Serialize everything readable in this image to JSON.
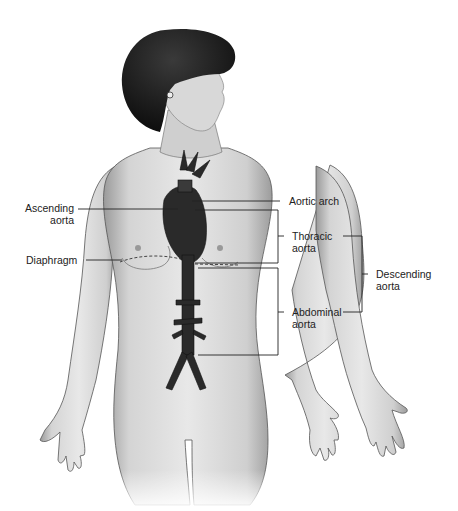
{
  "diagram": {
    "labels": {
      "ascending_aorta": [
        "Ascending",
        "aorta"
      ],
      "aortic_arch": [
        "Aortic arch"
      ],
      "thoracic_aorta": [
        "Thoracic",
        "aorta"
      ],
      "diaphragm": [
        "Diaphragm"
      ],
      "descending_aorta": [
        "Descending",
        "aorta"
      ],
      "abdominal_aorta": [
        "Abdominal",
        "aorta"
      ]
    }
  }
}
